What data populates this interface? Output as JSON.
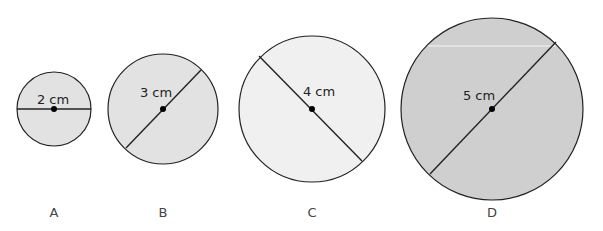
{
  "diagram": {
    "circles": [
      {
        "id": "A",
        "caption": "A",
        "diameter_label": "2 cm",
        "fill": "#e2e2e2",
        "cx": 54,
        "cy": 109,
        "r": 37,
        "line": [
          17,
          109,
          91,
          109
        ],
        "label_x": 53,
        "label_y": 104,
        "cap_x": 54,
        "cap_y": 217
      },
      {
        "id": "B",
        "caption": "B",
        "diameter_label": "3 cm",
        "fill": "#e2e2e2",
        "cx": 163,
        "cy": 109,
        "r": 55,
        "line": [
          126,
          148,
          201,
          70
        ],
        "label_x": 156,
        "label_y": 97,
        "cap_x": 163,
        "cap_y": 217
      },
      {
        "id": "C",
        "caption": "C",
        "diameter_label": "4 cm",
        "fill": "#f0f0f0",
        "cx": 312,
        "cy": 109,
        "r": 73,
        "line": [
          259,
          56,
          362,
          161
        ],
        "label_x": 319,
        "label_y": 96,
        "cap_x": 312,
        "cap_y": 217
      },
      {
        "id": "D",
        "caption": "D",
        "diameter_label": "5 cm",
        "fill": "#cfcfcf",
        "cx": 492,
        "cy": 109,
        "r": 91,
        "line": [
          430,
          174,
          556,
          42
        ],
        "label_x": 479,
        "label_y": 100,
        "cap_x": 492,
        "cap_y": 217
      }
    ],
    "stroke_color": "#222222",
    "center_dot_color": "#000000"
  }
}
